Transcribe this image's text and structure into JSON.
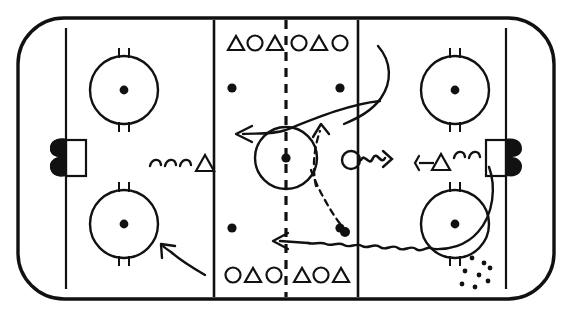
{
  "diagram": {
    "type": "ice-hockey-rink-play-diagram",
    "canvas": {
      "width": 572,
      "height": 317
    },
    "colors": {
      "ink": "#111111",
      "ice": "#ffffff"
    }
  },
  "rink": {
    "boards_label": "rink-boards",
    "corner_radius": 46,
    "bounds": {
      "x": 18,
      "y": 18,
      "width": 536,
      "height": 281
    },
    "goal_lines": [
      {
        "name": "goal-line-left",
        "x": 66
      },
      {
        "name": "goal-line-right",
        "x": 506
      }
    ],
    "blue_lines": [
      {
        "name": "blue-line-left",
        "x": 214
      },
      {
        "name": "blue-line-right",
        "x": 358
      }
    ],
    "center_line": {
      "name": "center-red-line",
      "x": 286,
      "style": "dashed"
    },
    "center_circle": {
      "cx": 286,
      "cy": 158,
      "r": 31
    },
    "center_dot": {
      "cx": 286,
      "cy": 158,
      "r": 4
    }
  },
  "faceoff_circles": [
    {
      "name": "faceoff-circle-top-left",
      "cx": 124,
      "cy": 90,
      "r": 34
    },
    {
      "name": "faceoff-circle-bottom-left",
      "cx": 124,
      "cy": 224,
      "r": 34
    },
    {
      "name": "faceoff-circle-top-right",
      "cx": 455,
      "cy": 90,
      "r": 34
    },
    {
      "name": "faceoff-circle-bottom-right",
      "cx": 455,
      "cy": 224,
      "r": 34
    }
  ],
  "neutral_zone_dots": [
    {
      "name": "neutral-dot-top-left",
      "cx": 232,
      "cy": 88
    },
    {
      "name": "neutral-dot-bottom-left",
      "cx": 232,
      "cy": 228
    },
    {
      "name": "neutral-dot-top-right",
      "cx": 340,
      "cy": 88
    },
    {
      "name": "neutral-dot-bottom-right",
      "cx": 340,
      "cy": 228
    }
  ],
  "goals": [
    {
      "name": "goal-net-left",
      "x": 66,
      "y": 140,
      "width": 20,
      "height": 36
    },
    {
      "name": "goal-net-right",
      "x": 486,
      "y": 140,
      "width": 20,
      "height": 36
    }
  ],
  "player_queues": {
    "top_left_of_center": {
      "name": "queue-top-left",
      "symbols": [
        "triangle",
        "circle",
        "triangle"
      ],
      "labels": [
        "△",
        "○",
        "△"
      ],
      "y": 44
    },
    "top_right_of_center": {
      "name": "queue-top-right",
      "symbols": [
        "circle",
        "triangle",
        "circle"
      ],
      "labels": [
        "○",
        "△",
        "○"
      ],
      "y": 44
    },
    "bottom_left_of_center": {
      "name": "queue-bottom-left",
      "symbols": [
        "circle",
        "triangle",
        "circle"
      ],
      "labels": [
        "○",
        "△",
        "○"
      ],
      "y": 276
    },
    "bottom_right_of_center": {
      "name": "queue-bottom-right",
      "symbols": [
        "triangle",
        "circle",
        "triangle"
      ],
      "labels": [
        "△",
        "○",
        "△"
      ],
      "y": 276
    }
  },
  "on_ice_players": [
    {
      "name": "player-left-triangle",
      "symbol": "triangle",
      "label": "△",
      "x": 206,
      "y": 163,
      "has_puck": true,
      "puck_squiggle": "left-of-player"
    },
    {
      "name": "player-center-circle",
      "symbol": "circle",
      "label": "○",
      "cx": 351,
      "cy": 160,
      "has_puck": true,
      "shot_squiggle": "right-of-player"
    },
    {
      "name": "player-right-triangle",
      "symbol": "triangle",
      "label": "△",
      "x": 441,
      "y": 163,
      "has_stick": true,
      "puck_squiggle": "right-of-player"
    }
  ],
  "pucks": [
    {
      "name": "puck-dashed-pass-end",
      "cx": 345,
      "cy": 232
    }
  ],
  "snow_spray": {
    "name": "snow-spray-marks",
    "count": 8,
    "region": "lower-right-corner"
  },
  "movement_paths": [
    {
      "name": "path-skate-curve-center-to-left",
      "style": "solid-with-arrowhead",
      "description": "curved skating route from upper right across center circle to the left, arrow pointing left"
    },
    {
      "name": "path-dashed-pass-up",
      "style": "dashed-with-arrowhead",
      "description": "dashed pass route curving upward right of center circle, arrow pointing up"
    },
    {
      "name": "path-dashed-pass-down",
      "style": "dashed",
      "description": "dashed pass route descending from center circle to puck in lower neutral zone"
    },
    {
      "name": "path-puck-carry-lower-right",
      "style": "wavy-then-straight-with-arrowhead",
      "description": "wavy puck carry from lower right circle running left to arrowhead"
    },
    {
      "name": "path-curl-lower-left",
      "style": "solid-with-arrowhead",
      "description": "short curved route in lower left zone, arrow pointing up-left"
    },
    {
      "name": "path-curl-upper-right-boards",
      "style": "solid",
      "description": "curved route along right boards from top down to the right circle"
    }
  ]
}
